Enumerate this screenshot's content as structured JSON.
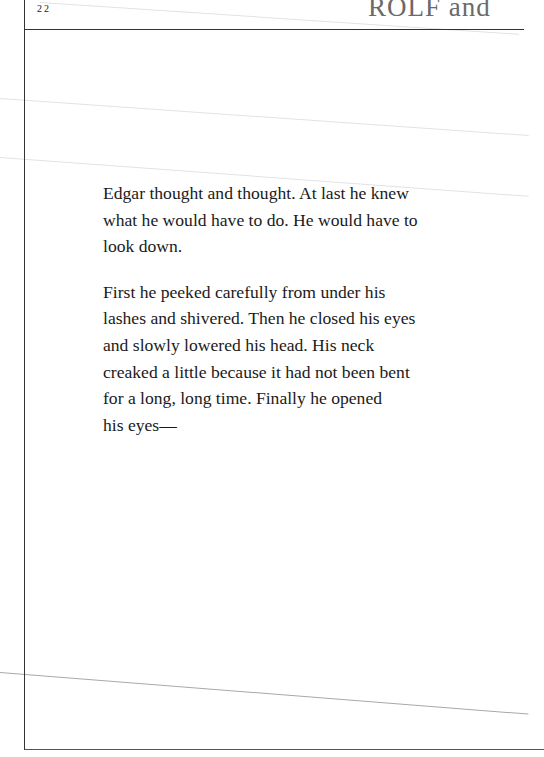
{
  "header": {
    "page_number": "22",
    "running_title": "ROLF and"
  },
  "body": {
    "paragraphs": [
      "Edgar thought and thought. At last he knew\nwhat he would have to do. He would have to\nlook down.",
      "First he peeked carefully from under his\nlashes and shivered. Then he closed his eyes\nand slowly lowered his head. His neck\ncreaked a little because it had not been bent\nfor a long, long time. Finally he opened\nhis eyes—"
    ]
  },
  "colors": {
    "text": "#1a1a1a",
    "running_title": "#6a6a6a",
    "frame": "#333333"
  }
}
